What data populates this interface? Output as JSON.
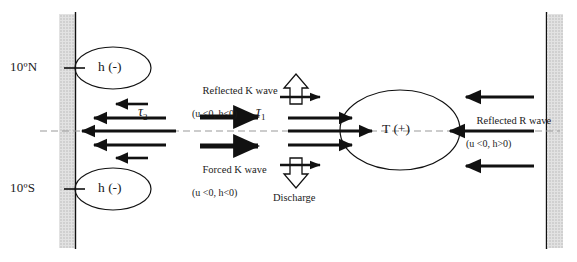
{
  "figure": {
    "type": "schematic-diagram"
  },
  "axis": {
    "latitude_labels": [
      {
        "name": "north-boundary",
        "text": "10ºN",
        "y": 68
      },
      {
        "name": "south-boundary",
        "text": "10ºS",
        "y": 189
      }
    ],
    "equator_line_style": "dashed"
  },
  "walls": {
    "left": {
      "name": "western-boundary",
      "hatch_color": "#c9c9c9",
      "line_color": "#111111"
    },
    "right": {
      "name": "eastern-boundary",
      "hatch_color": "#c9c9c9",
      "line_color": "#111111"
    }
  },
  "ellipses": [
    {
      "name": "thermocline-anomaly-north",
      "label": "h (-)",
      "cx": 113,
      "cy": 68,
      "rx": 38,
      "ry": 21
    },
    {
      "name": "thermocline-anomaly-south",
      "label": "h (-)",
      "cx": 113,
      "cy": 189,
      "rx": 38,
      "ry": 21
    },
    {
      "name": "warm-pool-anomaly",
      "label": "T (+)",
      "cx": 400,
      "cy": 130,
      "rx": 60,
      "ry": 40
    }
  ],
  "annotations": {
    "reflected_k_wave": {
      "line1": "Reflected K wave",
      "line2": "(u <0, h<0)"
    },
    "forced_k_wave": {
      "line1": "Forced K wave",
      "line2": "(u <0, h<0)"
    },
    "reflected_r_wave": {
      "line1": "Reflected R wave",
      "line2": "(u <0, h>0)"
    },
    "discharge": {
      "label": "Discharge"
    }
  },
  "stress_labels": [
    {
      "name": "tau-2",
      "symbol": "τ",
      "subscript": "2",
      "x": 140,
      "y": 112
    },
    {
      "name": "tau-1",
      "symbol": "τ",
      "subscript": "1",
      "x": 258,
      "y": 112
    }
  ],
  "arrows": {
    "westward_left_group": [
      {
        "name": "westward-arrow-1",
        "x1": 148,
        "x2": 112,
        "y": 104
      },
      {
        "name": "westward-arrow-2",
        "x1": 165,
        "x2": 90,
        "y": 118
      },
      {
        "name": "westward-arrow-3",
        "x1": 175,
        "x2": 78,
        "y": 131
      },
      {
        "name": "westward-arrow-4",
        "x1": 165,
        "x2": 90,
        "y": 145
      },
      {
        "name": "westward-arrow-5",
        "x1": 148,
        "x2": 112,
        "y": 158
      }
    ],
    "eastward_k_waves": [
      {
        "name": "reflected-k-wave-arrow",
        "x1": 200,
        "x2": 262,
        "y": 117
      },
      {
        "name": "forced-k-wave-arrow",
        "x1": 200,
        "x2": 262,
        "y": 146
      }
    ],
    "eastward_center_group": [
      {
        "name": "eastward-arrow-upper",
        "x1": 295,
        "x2": 352,
        "y": 118
      },
      {
        "name": "eastward-arrow-mid",
        "x1": 295,
        "x2": 368,
        "y": 131
      },
      {
        "name": "eastward-arrow-lower",
        "x1": 295,
        "x2": 352,
        "y": 145
      }
    ],
    "discharge_hollow": [
      {
        "name": "discharge-arrow-up",
        "direction": "up",
        "x": 296,
        "y": 84
      },
      {
        "name": "discharge-arrow-down",
        "direction": "down",
        "x": 296,
        "y": 178
      },
      {
        "name": "discharge-side-arrow-upper",
        "x1": 288,
        "x2": 320,
        "y": 97
      },
      {
        "name": "discharge-side-arrow-lower",
        "x1": 288,
        "x2": 320,
        "y": 165
      }
    ],
    "westward_right_group": [
      {
        "name": "reflected-r-wave-arrow-upper",
        "x1": 528,
        "x2": 468,
        "y": 97
      },
      {
        "name": "reflected-r-wave-arrow-mid",
        "x1": 528,
        "x2": 452,
        "y": 131
      },
      {
        "name": "reflected-r-wave-arrow-lower",
        "x1": 528,
        "x2": 468,
        "y": 166
      }
    ]
  },
  "colors": {
    "stroke": "#111111",
    "hatch": "#c9c9c9",
    "dashed": "#9a9a9a"
  }
}
